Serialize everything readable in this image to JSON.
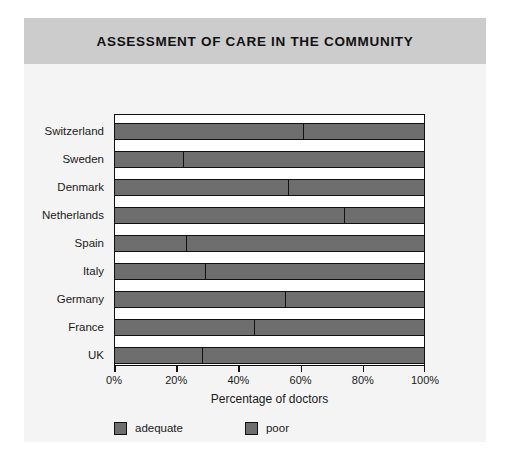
{
  "figure": {
    "title": "ASSESSMENT OF CARE IN THE COMMUNITY",
    "header_color": "#cccccc",
    "background_color": "#f4f4f4",
    "bar_color": "#6e6e6e",
    "outline_color": "#111111"
  },
  "chart_data": {
    "type": "bar",
    "orientation": "horizontal",
    "stacked": true,
    "stacked_total": 100,
    "title": "ASSESSMENT OF CARE IN THE COMMUNITY",
    "xlabel": "Percentage of doctors",
    "ylabel": "",
    "xlim": [
      0,
      100
    ],
    "grid": false,
    "legend_position": "bottom-left",
    "xtick_values": [
      0,
      20,
      40,
      60,
      80,
      100
    ],
    "xtick_labels": [
      "0%",
      "20%",
      "40%",
      "60%",
      "80%",
      "100%"
    ],
    "categories": [
      "Switzerland",
      "Sweden",
      "Denmark",
      "Netherlands",
      "Spain",
      "Italy",
      "Germany",
      "France",
      "UK"
    ],
    "series": [
      {
        "name": "adequate",
        "color": "#6e6e6e",
        "values": [
          61,
          22,
          56,
          74,
          23,
          29,
          55,
          45,
          28
        ]
      },
      {
        "name": "poor",
        "color": "#6e6e6e",
        "values": [
          39,
          78,
          44,
          26,
          77,
          71,
          45,
          55,
          72
        ]
      }
    ]
  },
  "legend": {
    "items": [
      {
        "label": "adequate"
      },
      {
        "label": "poor"
      }
    ]
  }
}
